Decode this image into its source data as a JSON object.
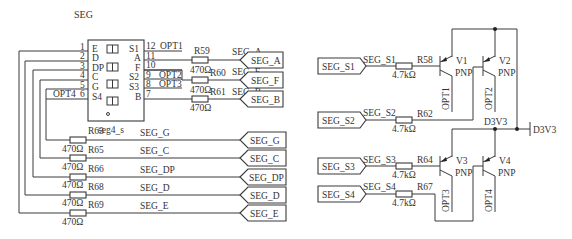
{
  "component": {
    "title": "SEG",
    "part": "seg4_s",
    "left_pins": [
      {
        "num": "1",
        "name": "E"
      },
      {
        "num": "2",
        "name": "D"
      },
      {
        "num": "3",
        "name": "DP"
      },
      {
        "num": "4",
        "name": "C"
      },
      {
        "num": "5",
        "name": "G"
      },
      {
        "num": "6",
        "name": "S4",
        "net": "OPT4"
      }
    ],
    "right_pins": [
      {
        "num": "12",
        "name": "S1",
        "net": "OPT1"
      },
      {
        "num": "11",
        "name": "A"
      },
      {
        "num": "10",
        "name": "F"
      },
      {
        "num": "9",
        "name": "S2",
        "net": "OPT2"
      },
      {
        "num": "8",
        "name": "S3",
        "net": "OPT3"
      },
      {
        "num": "7",
        "name": "B"
      }
    ]
  },
  "segment_resistors_top": [
    {
      "ref": "R59",
      "value": "470Ω",
      "net": "SEG_A",
      "port": "SEG_A"
    },
    {
      "ref": "R60",
      "value": "470Ω",
      "net": "SEG_F",
      "port": "SEG_F"
    },
    {
      "ref": "R61",
      "value": "470Ω",
      "net": "SEG_B",
      "port": "SEG_B"
    }
  ],
  "segment_resistors_bottom": [
    {
      "ref": "R63",
      "value": "470Ω",
      "net": "SEG_G",
      "port": "SEG_G"
    },
    {
      "ref": "R65",
      "value": "470Ω",
      "net": "SEG_C",
      "port": "SEG_C"
    },
    {
      "ref": "R66",
      "value": "470Ω",
      "net": "SEG_DP",
      "port": "SEG_DP"
    },
    {
      "ref": "R68",
      "value": "470Ω",
      "net": "SEG_D",
      "port": "SEG_D"
    },
    {
      "ref": "R69",
      "value": "470Ω",
      "net": "SEG_E",
      "port": "SEG_E"
    }
  ],
  "select_lines": [
    {
      "port": "SEG_S1",
      "net": "SEG_S1",
      "ref": "R58",
      "value": "4.7kΩ"
    },
    {
      "port": "SEG_S2",
      "net": "SEG_S2",
      "ref": "R62",
      "value": "4.7kΩ"
    },
    {
      "port": "SEG_S3",
      "net": "SEG_S3",
      "ref": "R64",
      "value": "4.7kΩ"
    },
    {
      "port": "SEG_S4",
      "net": "SEG_S4",
      "ref": "R67",
      "value": "4.7kΩ"
    }
  ],
  "transistors": [
    {
      "ref": "V1",
      "type": "PNP",
      "collector_net": "OPT1"
    },
    {
      "ref": "V2",
      "type": "PNP",
      "collector_net": "OPT2"
    },
    {
      "ref": "V3",
      "type": "PNP",
      "collector_net": "OPT3"
    },
    {
      "ref": "V4",
      "type": "PNP",
      "collector_net": "OPT4"
    }
  ],
  "power": {
    "net_label": "D3V3",
    "port_label": "D3V3"
  }
}
